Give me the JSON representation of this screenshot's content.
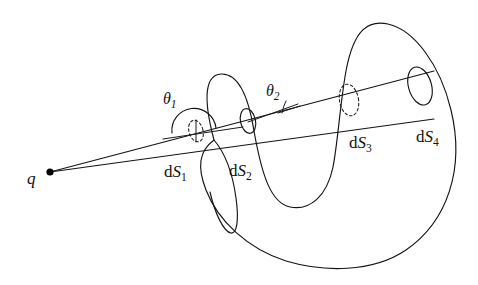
{
  "figure": {
    "background_color": "#ffffff",
    "line_color": "#141414",
    "width": 478,
    "height": 285
  },
  "labels": {
    "charge": {
      "text": "q",
      "x": 27,
      "y": 184,
      "description": "point charge label"
    },
    "theta1": {
      "symbol": "θ",
      "subscript": "1",
      "x": 163,
      "y": 104,
      "description": "angle between cone ray and surface normal at dS1"
    },
    "theta2": {
      "symbol": "θ",
      "subscript": "2",
      "x": 266,
      "y": 96,
      "description": "angle between cone ray and surface normal at dS2"
    },
    "dS1": {
      "prefix": "d",
      "symbol": "S",
      "subscript": "1",
      "x": 164,
      "y": 177,
      "description": "first surface element, dashed ellipse"
    },
    "dS2": {
      "prefix": "d",
      "symbol": "S",
      "subscript": "2",
      "x": 229,
      "y": 176,
      "description": "second surface element, solid ellipse"
    },
    "dS3": {
      "prefix": "d",
      "symbol": "S",
      "subscript": "3",
      "x": 349,
      "y": 148,
      "description": "third surface element, dashed ellipse"
    },
    "dS4": {
      "prefix": "d",
      "symbol": "S",
      "subscript": "4",
      "x": 416,
      "y": 142,
      "description": "fourth surface element, solid ellipse at cone end"
    }
  },
  "elements": {
    "charge_point": {
      "name": "charge-point",
      "cx": 50,
      "cy": 172,
      "r": 3.6
    },
    "cone": {
      "apex_x": 50,
      "apex_y": 172,
      "upper_ray_end_x": 434,
      "upper_ray_end_y": 71,
      "lower_ray_end_x": 434,
      "lower_ray_end_y": 119
    },
    "surface_elements": [
      {
        "id": "dS1",
        "cx": 196,
        "cy": 131,
        "rx": 7,
        "ry": 11,
        "style": "dashed",
        "rotate": -16
      },
      {
        "id": "dS2",
        "cx": 248,
        "cy": 121,
        "rx": 7.5,
        "ry": 12.5,
        "style": "solid",
        "rotate": -12
      },
      {
        "id": "dS3",
        "cx": 349,
        "cy": 100,
        "rx": 9.5,
        "ry": 16,
        "style": "dashed",
        "rotate": -10
      },
      {
        "id": "dS4",
        "cx": 420,
        "cy": 86,
        "rx": 11.5,
        "ry": 19.5,
        "style": "solid",
        "rotate": -16
      }
    ]
  }
}
